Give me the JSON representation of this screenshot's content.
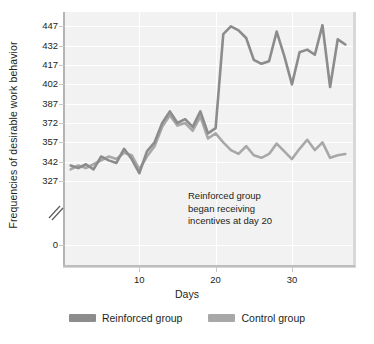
{
  "chart_data": {
    "type": "line",
    "title": "",
    "xlabel": "Days",
    "ylabel": "Frequencies of desirable work behavior",
    "xlim": [
      0,
      38
    ],
    "ylim": [
      320,
      452
    ],
    "grid": true,
    "legend_position": "bottom",
    "x_ticks": [
      "10",
      "20",
      "30"
    ],
    "x_tick_values": [
      10,
      20,
      30
    ],
    "y_ticks": [
      "327",
      "342",
      "357",
      "372",
      "387",
      "402",
      "417",
      "432",
      "447"
    ],
    "y_tick_values": [
      327,
      342,
      357,
      372,
      387,
      402,
      417,
      432,
      447
    ],
    "y_axis_zero_label": "0",
    "y_axis_break": true,
    "annotation": {
      "line1": "Reinforced group",
      "line2": "began receiving",
      "line3": "incentives at day 20"
    },
    "colors": {
      "reinforced": "#8c8c8c",
      "control": "#a8a8a8",
      "plot_background": "#f2f2f2",
      "gridline": "#ffffff",
      "axis": "#bdbdbd",
      "text": "#231f20"
    },
    "x": [
      1,
      2,
      3,
      4,
      5,
      6,
      7,
      8,
      9,
      10,
      11,
      12,
      13,
      14,
      15,
      16,
      17,
      18,
      19,
      20,
      21,
      22,
      23,
      24,
      25,
      26,
      27,
      28,
      29,
      30,
      31,
      32,
      33,
      34,
      35,
      36,
      37
    ],
    "series": [
      {
        "name": "Reinforced group",
        "color": "#8c8c8c",
        "values": [
          339,
          337,
          340,
          336,
          346,
          343,
          341,
          352,
          344,
          333,
          350,
          357,
          372,
          381,
          372,
          375,
          369,
          381,
          364,
          368,
          441,
          447,
          444,
          438,
          421,
          418,
          420,
          443,
          424,
          402,
          427,
          429,
          425,
          448,
          400,
          437,
          433
        ]
      },
      {
        "name": "Control group",
        "color": "#a8a8a8",
        "values": [
          336,
          339,
          337,
          340,
          343,
          346,
          344,
          349,
          347,
          336,
          346,
          354,
          369,
          378,
          370,
          372,
          366,
          377,
          360,
          364,
          357,
          351,
          348,
          354,
          347,
          345,
          348,
          356,
          350,
          344,
          352,
          359,
          351,
          357,
          345,
          347,
          348
        ]
      }
    ]
  },
  "legend": {
    "items": [
      {
        "label": "Reinforced group",
        "color": "#8c8c8c"
      },
      {
        "label": "Control group",
        "color": "#a8a8a8"
      }
    ]
  }
}
